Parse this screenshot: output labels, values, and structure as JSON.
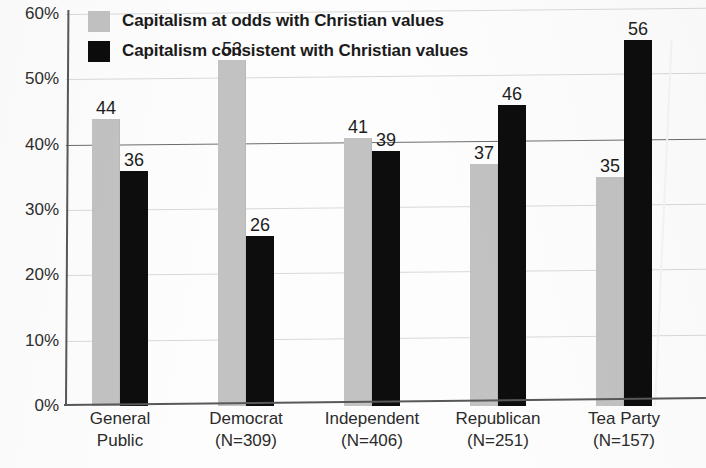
{
  "title_partial": "values",
  "legend": {
    "position": "top-left",
    "items": [
      {
        "key": "odds",
        "label": "Capitalism at odds with Christian values",
        "color": "#c2c2c2"
      },
      {
        "key": "consistent",
        "label": "Capitalism consistent with Christian values",
        "color": "#0c0c0c"
      }
    ]
  },
  "chart_data": {
    "type": "bar",
    "title": "values",
    "xlabel": "",
    "ylabel": "",
    "ylim": [
      0,
      60
    ],
    "ytick_labels": [
      "0%",
      "10%",
      "20%",
      "30%",
      "40%",
      "50%",
      "60%"
    ],
    "ytick_values": [
      0,
      10,
      20,
      30,
      40,
      50,
      60
    ],
    "grid": true,
    "emphasized_gridline": 40,
    "legend_position": "top-left",
    "categories": [
      "General Public",
      "Democrat (N=309)",
      "Independent (N=406)",
      "Republican (N=251)",
      "Tea Party (N=157)"
    ],
    "category_lines": [
      [
        "General",
        "Public"
      ],
      [
        "Democrat",
        "(N=309)"
      ],
      [
        "Independent",
        "(N=406)"
      ],
      [
        "Republican",
        "(N=251)"
      ],
      [
        "Tea Party",
        "(N=157)"
      ]
    ],
    "sample_sizes": [
      null,
      309,
      406,
      251,
      157
    ],
    "series": [
      {
        "name": "Capitalism at odds with Christian values",
        "color": "#c2c2c2",
        "values": [
          44,
          53,
          41,
          37,
          35
        ]
      },
      {
        "name": "Capitalism consistent with Christian values",
        "color": "#0c0c0c",
        "values": [
          36,
          26,
          39,
          46,
          56
        ]
      }
    ]
  }
}
